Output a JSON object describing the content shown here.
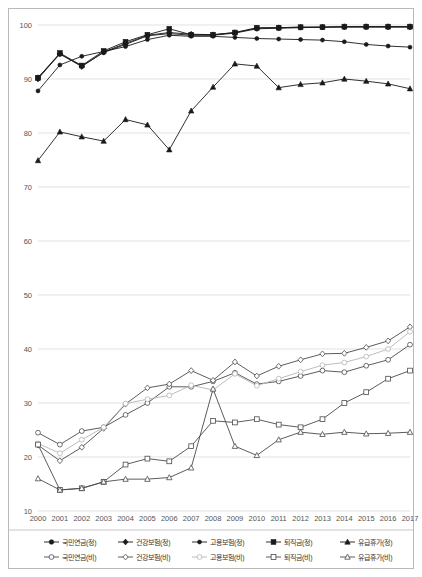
{
  "chart_data": {
    "type": "line",
    "title": "",
    "subtitle": "",
    "xlabel": "",
    "ylabel": "",
    "xlim": [
      2000,
      2017
    ],
    "ylim": [
      10,
      100
    ],
    "grid": true,
    "legend_position": "bottom",
    "yticks": [
      10,
      20,
      30,
      40,
      50,
      60,
      70,
      80,
      90,
      100
    ],
    "categories": [
      "2000",
      "2001",
      "2002",
      "2003",
      "2004",
      "2005",
      "2006",
      "2007",
      "2008",
      "2009",
      "2010",
      "2011",
      "2012",
      "2013",
      "2014",
      "2015",
      "2016",
      "2017"
    ],
    "series": [
      {
        "name": "국민연금(정)",
        "key": "national-pension-regular",
        "marker": "circle-filled",
        "color": "#1a1a1a",
        "values": [
          90.3,
          94.6,
          92.4,
          94.9,
          96.4,
          98.0,
          98.4,
          98.1,
          98.1,
          98.5,
          99.3,
          99.4,
          99.5,
          99.6,
          99.6,
          99.6,
          99.6,
          99.6
        ]
      },
      {
        "name": "건강보험(정)",
        "key": "health-insurance-regular",
        "marker": "diamond-filled",
        "color": "#1a1a1a",
        "values": [
          90.0,
          94.7,
          92.3,
          95.0,
          96.6,
          98.1,
          98.6,
          98.3,
          98.2,
          98.6,
          99.4,
          99.5,
          99.6,
          99.6,
          99.7,
          99.7,
          99.7,
          99.7
        ]
      },
      {
        "name": "고용보험(정)",
        "key": "employment-insurance-regular",
        "marker": "circle-small-filled",
        "color": "#1a1a1a",
        "values": [
          87.8,
          92.6,
          94.2,
          95.1,
          96.0,
          97.3,
          98.1,
          97.9,
          97.9,
          97.7,
          97.5,
          97.4,
          97.3,
          97.2,
          96.9,
          96.4,
          96.1,
          95.9
        ]
      },
      {
        "name": "퇴직금(정)",
        "key": "severance-pay-regular",
        "marker": "square-filled",
        "color": "#1a1a1a",
        "values": [
          90.2,
          94.8,
          92.5,
          95.2,
          96.9,
          98.2,
          99.3,
          98.2,
          98.2,
          98.6,
          99.5,
          99.5,
          99.6,
          99.6,
          99.7,
          99.7,
          99.7,
          99.7
        ]
      },
      {
        "name": "유급휴가(정)",
        "key": "paid-leave-regular",
        "marker": "triangle-filled",
        "color": "#1a1a1a",
        "values": [
          74.9,
          80.2,
          79.3,
          78.5,
          82.5,
          81.5,
          76.9,
          84.1,
          88.5,
          92.8,
          92.4,
          88.4,
          89.0,
          89.3,
          90.0,
          89.6,
          89.1,
          88.2
        ]
      },
      {
        "name": "국민연금(비)",
        "key": "national-pension-nonregular",
        "marker": "circle-open",
        "color": "#4a4a4a",
        "values": [
          24.5,
          22.3,
          24.8,
          25.5,
          27.8,
          30.0,
          33.0,
          33.0,
          34.0,
          35.6,
          33.5,
          34.0,
          35.0,
          36.0,
          35.7,
          36.9,
          38.0,
          40.8
        ]
      },
      {
        "name": "건강보험(비)",
        "key": "health-insurance-nonregular",
        "marker": "diamond-open",
        "color": "#4a4a4a",
        "values": [
          22.2,
          19.3,
          21.8,
          25.3,
          29.8,
          32.8,
          33.5,
          36.0,
          34.2,
          37.6,
          35.0,
          36.8,
          38.0,
          39.1,
          39.2,
          40.3,
          41.5,
          44.1
        ]
      },
      {
        "name": "고용보험(비)",
        "key": "employment-insurance-nonregular",
        "marker": "circle-open-light",
        "color": "#b5b5b5",
        "values": [
          22.5,
          20.7,
          23.2,
          25.5,
          29.9,
          30.7,
          31.4,
          33.3,
          32.4,
          35.4,
          33.2,
          34.5,
          35.8,
          37.0,
          37.5,
          38.6,
          40.0,
          43.2
        ]
      },
      {
        "name": "퇴직금(비)",
        "key": "severance-pay-nonregular",
        "marker": "square-open",
        "color": "#4a4a4a",
        "values": [
          22.3,
          13.9,
          14.2,
          15.4,
          18.6,
          19.7,
          19.2,
          22.0,
          26.7,
          26.4,
          27.0,
          26.0,
          25.5,
          27.0,
          30.0,
          32.0,
          34.5,
          36.0
        ]
      },
      {
        "name": "유급휴가(비)",
        "key": "paid-leave-nonregular",
        "marker": "triangle-open",
        "color": "#4a4a4a",
        "values": [
          16.0,
          13.9,
          14.2,
          15.4,
          15.9,
          15.9,
          16.2,
          18.0,
          32.6,
          22.0,
          20.3,
          23.2,
          24.6,
          24.2,
          24.6,
          24.3,
          24.4,
          24.6
        ]
      }
    ]
  },
  "legend": {
    "row1": [
      {
        "label": "국민연금(정)",
        "key": "national-pension-regular"
      },
      {
        "label": "건강보험(정)",
        "key": "health-insurance-regular"
      },
      {
        "label": "고용보험(정)",
        "key": "employment-insurance-regular"
      },
      {
        "label": "퇴직금(정)",
        "key": "severance-pay-regular"
      },
      {
        "label": "유급휴가(정)",
        "key": "paid-leave-regular"
      }
    ],
    "row2": [
      {
        "label": "국민연금(비)",
        "key": "national-pension-nonregular"
      },
      {
        "label": "건강보험(비)",
        "key": "health-insurance-nonregular"
      },
      {
        "label": "고용보험(비)",
        "key": "employment-insurance-nonregular"
      },
      {
        "label": "퇴직금(비)",
        "key": "severance-pay-nonregular"
      },
      {
        "label": "유급휴가(비)",
        "key": "paid-leave-nonregular"
      }
    ]
  },
  "colors": {
    "dark": "#1a1a1a",
    "mid": "#4a4a4a",
    "light": "#b5b5b5",
    "grid": "#d6d6d6",
    "frame": "#b9b9b9"
  }
}
